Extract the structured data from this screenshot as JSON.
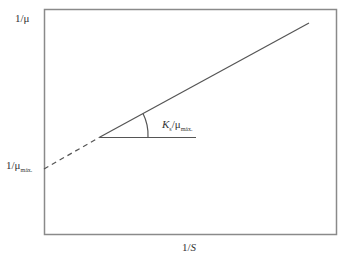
{
  "diagram": {
    "y_axis_label": "1/μ",
    "y_intercept_label": {
      "main": "1/μ",
      "sub": "máx."
    },
    "x_axis_label": {
      "main": "1/",
      "italic": "S"
    },
    "slope_label": {
      "k": "K",
      "k_sub": "s",
      "sep": "/μ",
      "mu_sub": "máx."
    },
    "colors": {
      "frame": "#8a8a8a",
      "line": "#555555",
      "text": "#333333"
    }
  }
}
